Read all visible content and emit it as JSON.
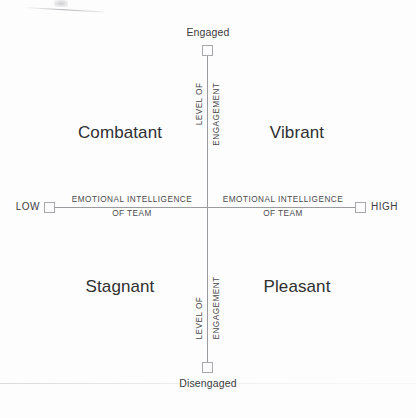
{
  "diagram": {
    "type": "quadrant-matrix",
    "line_color": "#9a9a9f",
    "text_color": "#3a3a3c",
    "background_color": "#fdfdfd"
  },
  "axes": {
    "vertical": {
      "caption_line1": "LEVEL OF",
      "caption_line2": "ENGAGEMENT",
      "top_pole": "Engaged",
      "bottom_pole": "Disengaged"
    },
    "horizontal": {
      "caption_line1": "EMOTIONAL INTELLIGENCE",
      "caption_line2": "OF TEAM",
      "left_pole": "LOW",
      "right_pole": "HIGH"
    }
  },
  "quadrants": [
    {
      "position": "top-left",
      "label": "Combatant"
    },
    {
      "position": "top-right",
      "label": "Vibrant"
    },
    {
      "position": "bottom-left",
      "label": "Stagnant"
    },
    {
      "position": "bottom-right",
      "label": "Pleasant"
    }
  ],
  "chart_data": {
    "type": "scatter",
    "title": "",
    "xlabel": "EMOTIONAL INTELLIGENCE OF TEAM",
    "ylabel": "LEVEL OF ENGAGEMENT",
    "x_tick_labels": [
      "LOW",
      "HIGH"
    ],
    "y_tick_labels": [
      "Disengaged",
      "Engaged"
    ],
    "grid": false,
    "legend": "none",
    "quadrant_labels": {
      "top_left": "Combatant",
      "top_right": "Vibrant",
      "bottom_left": "Stagnant",
      "bottom_right": "Pleasant"
    }
  }
}
